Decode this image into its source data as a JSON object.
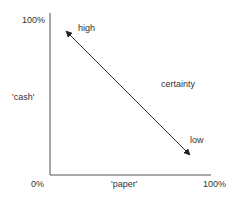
{
  "diagram": {
    "y_axis": {
      "top_label": "100%",
      "name": "'cash'"
    },
    "x_axis": {
      "origin_label": "0%",
      "name": "'paper'",
      "end_label": "100%"
    },
    "arrow": {
      "label": "certainty",
      "start_label": "high",
      "end_label": "low",
      "direction": "bidirectional"
    },
    "colors": {
      "axis": "#555555",
      "arrow": "#333333",
      "text": "#333333"
    }
  }
}
